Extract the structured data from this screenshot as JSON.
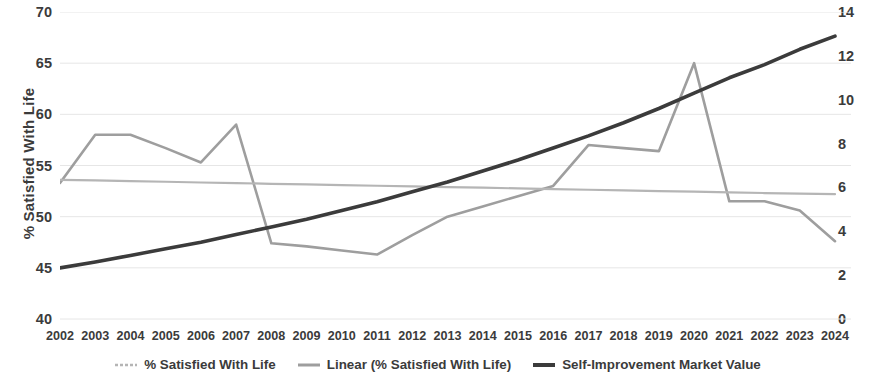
{
  "chart_data": {
    "type": "line",
    "title": "",
    "xlabel": "",
    "ylabel": "% Satisfied With Life",
    "y2label": "",
    "categories": [
      "2002",
      "2003",
      "2004",
      "2005",
      "2006",
      "2007",
      "2008",
      "2009",
      "2010",
      "2011",
      "2012",
      "2013",
      "2014",
      "2015",
      "2016",
      "2017",
      "2018",
      "2019",
      "2020",
      "2021",
      "2022",
      "2023",
      "2024"
    ],
    "ylim": [
      40,
      70
    ],
    "ytick_step": 5,
    "yticks": [
      "40",
      "45",
      "50",
      "55",
      "60",
      "65",
      "70"
    ],
    "y2lim": [
      0,
      14
    ],
    "y2tick_step": 2,
    "y2ticks": [
      "0",
      "2",
      "4",
      "6",
      "8",
      "10",
      "12",
      "14"
    ],
    "grid": true,
    "legend_position": "bottom",
    "series": [
      {
        "name": "% Satisfied With Life",
        "axis": "left",
        "color": "#9e9e9e",
        "style": "line",
        "width": 2.6,
        "values": [
          53.3,
          58.0,
          58.0,
          56.7,
          55.3,
          59.0,
          47.4,
          47.1,
          46.7,
          46.3,
          48.2,
          50.0,
          51.0,
          52.0,
          53.0,
          57.0,
          56.7,
          56.4,
          65.0,
          51.5,
          51.5,
          50.6,
          47.6
        ]
      },
      {
        "name": "Linear (% Satisfied With Life)",
        "axis": "left",
        "color": "#b5b5b5",
        "style": "trendline",
        "width": 2.2,
        "values": [
          53.6,
          53.54,
          53.47,
          53.41,
          53.34,
          53.28,
          53.21,
          53.15,
          53.08,
          53.02,
          52.96,
          52.89,
          52.83,
          52.76,
          52.7,
          52.63,
          52.57,
          52.5,
          52.44,
          52.38,
          52.31,
          52.25,
          52.2
        ]
      },
      {
        "name": "Self-Improvement Market Value",
        "axis": "right",
        "color": "#3b3b3b",
        "style": "line",
        "width": 3.6,
        "values": [
          2.33,
          2.6,
          2.9,
          3.2,
          3.5,
          3.85,
          4.2,
          4.55,
          4.95,
          5.35,
          5.8,
          6.25,
          6.75,
          7.25,
          7.8,
          8.35,
          8.95,
          9.6,
          10.3,
          11.0,
          11.6,
          12.3,
          12.9
        ]
      }
    ]
  },
  "legend": {
    "items": [
      {
        "label": "% Satisfied With Life",
        "color": "#b5b5b5",
        "marker": "dashed-line-swatch"
      },
      {
        "label": "Linear (% Satisfied With Life)",
        "color": "#9e9e9e",
        "marker": "solid-line-swatch"
      },
      {
        "label": "Self-Improvement Market Value",
        "color": "#3b3b3b",
        "marker": "thick-line-swatch"
      }
    ]
  },
  "colors": {
    "grid": "#e6e6e6",
    "text": "#3b3b3b",
    "satisfaction": "#9e9e9e",
    "trendline": "#b5b5b5",
    "market": "#3b3b3b",
    "background": "#ffffff"
  }
}
